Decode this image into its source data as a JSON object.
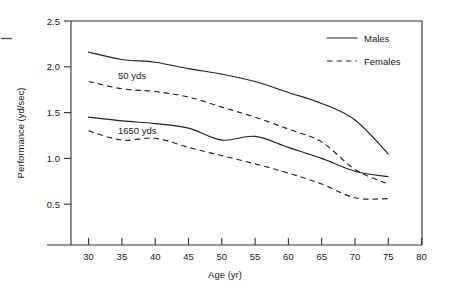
{
  "chart_data": {
    "type": "line",
    "title": "",
    "xlabel": "Age (yr)",
    "ylabel": "Performance (yd/sec)",
    "xlim": [
      27,
      80
    ],
    "ylim": [
      0.0,
      2.5
    ],
    "xticks": [
      30,
      35,
      40,
      45,
      50,
      55,
      60,
      65,
      70,
      75,
      80
    ],
    "yticks": [
      0.5,
      1.0,
      1.5,
      2.0,
      2.5
    ],
    "xtick_labels": [
      "30",
      "35",
      "40",
      "45",
      "50",
      "55",
      "60",
      "65",
      "70",
      "75",
      "80"
    ],
    "ytick_labels": [
      "0.5",
      "1.0",
      "1.5",
      "2.0",
      "2.5"
    ],
    "grid": false,
    "legend_position": "top-right",
    "legend": [
      {
        "label": "Males",
        "style": "solid"
      },
      {
        "label": "Females",
        "style": "dashed"
      }
    ],
    "annotations": [
      {
        "text": "50 yds",
        "x": 37.5,
        "y": 1.94
      },
      {
        "text": "1650 yds",
        "x": 38.5,
        "y": 1.27
      }
    ],
    "x": [
      30,
      35,
      40,
      45,
      50,
      55,
      60,
      65,
      70,
      75
    ],
    "series": [
      {
        "name": "Males 50 yds",
        "sex": "Males",
        "event": "50 yds",
        "style": "solid",
        "values": [
          2.16,
          2.08,
          2.05,
          1.98,
          1.92,
          1.84,
          1.72,
          1.6,
          1.42,
          1.05
        ]
      },
      {
        "name": "Females 50 yds",
        "sex": "Females",
        "event": "50 yds",
        "style": "dashed",
        "values": [
          1.84,
          1.76,
          1.73,
          1.67,
          1.56,
          1.45,
          1.32,
          1.18,
          0.88,
          0.72
        ]
      },
      {
        "name": "Males 1650 yds",
        "sex": "Males",
        "event": "1650 yds",
        "style": "solid",
        "values": [
          1.45,
          1.41,
          1.38,
          1.33,
          1.2,
          1.24,
          1.12,
          1.0,
          0.86,
          0.8
        ]
      },
      {
        "name": "Females 1650 yds",
        "sex": "Females",
        "event": "1650 yds",
        "style": "dashed",
        "values": [
          1.3,
          1.2,
          1.22,
          1.12,
          1.03,
          0.94,
          0.84,
          0.72,
          0.57,
          0.56
        ]
      }
    ]
  }
}
